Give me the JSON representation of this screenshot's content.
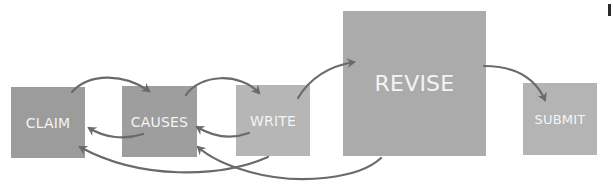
{
  "diagram": {
    "type": "process-flow",
    "nodes": [
      {
        "id": "claim",
        "label": "CLAIM",
        "x": 11,
        "y": 87,
        "w": 74,
        "h": 71,
        "color": "#9c9c9c",
        "font_size": 14
      },
      {
        "id": "causes",
        "label": "CAUSES",
        "x": 122,
        "y": 86,
        "w": 75,
        "h": 71,
        "color": "#9e9e9e",
        "font_size": 14
      },
      {
        "id": "write",
        "label": "WRITE",
        "x": 236,
        "y": 85,
        "w": 74,
        "h": 71,
        "color": "#b6b6b6",
        "font_size": 14
      },
      {
        "id": "revise",
        "label": "REVISE",
        "x": 343,
        "y": 11,
        "w": 143,
        "h": 145,
        "color": "#ababab",
        "font_size": 22
      },
      {
        "id": "submit",
        "label": "SUBMIT",
        "x": 523,
        "y": 83,
        "w": 74,
        "h": 72,
        "color": "#b4b4b4",
        "font_size": 13
      }
    ],
    "edges": [
      {
        "from": "claim",
        "to": "causes",
        "direction": "forward"
      },
      {
        "from": "causes",
        "to": "write",
        "direction": "forward"
      },
      {
        "from": "write",
        "to": "revise",
        "direction": "forward"
      },
      {
        "from": "revise",
        "to": "submit",
        "direction": "forward"
      },
      {
        "from": "causes",
        "to": "claim",
        "direction": "back"
      },
      {
        "from": "write",
        "to": "causes",
        "direction": "back"
      },
      {
        "from": "write",
        "to": "claim",
        "direction": "back"
      },
      {
        "from": "revise",
        "to": "causes",
        "direction": "back"
      }
    ],
    "arrow_color": "#6a6a6a"
  }
}
